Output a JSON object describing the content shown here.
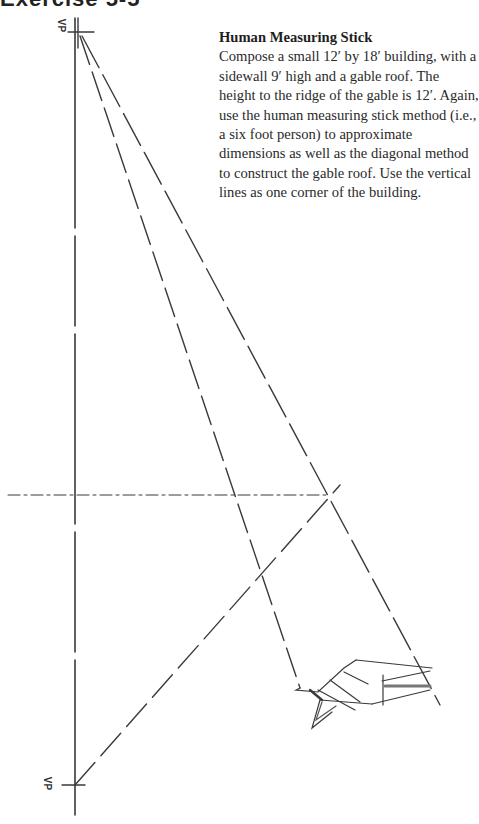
{
  "page": {
    "header_fragment": "Exercise 5-5"
  },
  "exercise": {
    "title": "Human Measuring Stick",
    "body": "Compose a small 12′ by 18′ building, with a sidewall 9′ high and a gable roof. The height to the ridge of the gable is 12′. Again, use the human measuring stick method (i.e., a six foot person) to approximate dimensions as well as the diagonal method to construct the gable roof. Use the vertical lines as one corner of the building."
  },
  "drawing": {
    "top_vp_label": "VP",
    "bottom_vp_label": "VP",
    "line_color": "#3a3a3a"
  }
}
